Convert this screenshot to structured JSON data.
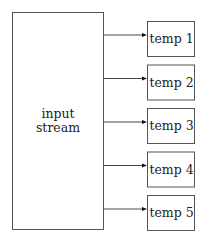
{
  "diagram": {
    "source": {
      "label_lines": [
        "input",
        "stream"
      ]
    },
    "targets": [
      {
        "label": "temp 1"
      },
      {
        "label": "temp 2"
      },
      {
        "label": "temp 3"
      },
      {
        "label": "temp 4"
      },
      {
        "label": "temp 5"
      }
    ],
    "edges": [
      {
        "from": "input stream",
        "to": "temp 1"
      },
      {
        "from": "input stream",
        "to": "temp 2"
      },
      {
        "from": "input stream",
        "to": "temp 3"
      },
      {
        "from": "input stream",
        "to": "temp 4"
      },
      {
        "from": "input stream",
        "to": "temp 5"
      }
    ],
    "colors": {
      "box_stroke": "#555555",
      "arrow": "#333333",
      "text": "#222222",
      "background": "#ffffff"
    }
  }
}
